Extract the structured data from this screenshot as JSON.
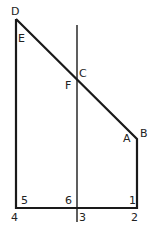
{
  "diagram": {
    "stroke_color": "#1a1a1a",
    "background": "#ffffff",
    "vertex_labels": {
      "D": "D",
      "E": "E",
      "C": "C",
      "F": "F",
      "A": "A",
      "B": "B"
    },
    "corner_labels": {
      "five": "5",
      "six": "6",
      "one": "1",
      "four": "4",
      "three": "3",
      "two": "2"
    }
  }
}
